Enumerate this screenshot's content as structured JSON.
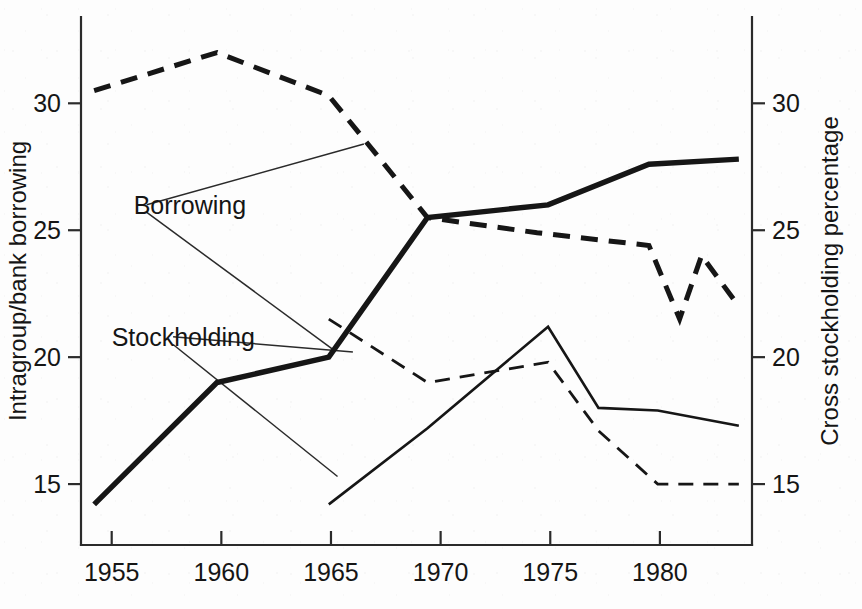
{
  "chart_data": {
    "type": "line",
    "title": "",
    "xlabel": "",
    "ylabel": "Intragroup/bank borrowing",
    "y2label": "Cross stockholding percentage",
    "xlim": [
      1953.6,
      1984.2
    ],
    "ylim": [
      12.6,
      33.4
    ],
    "y2lim": [
      12.6,
      33.4
    ],
    "grid": false,
    "legend_position": "inline-annotations",
    "xticks": [
      1955,
      1960,
      1965,
      1970,
      1975,
      1980
    ],
    "xtick_labels": [
      "1955",
      "1960",
      "1965",
      "1970",
      "1975",
      "1980"
    ],
    "yticks": [
      15,
      20,
      25,
      30
    ],
    "ytick_labels": [
      "15",
      "20",
      "25",
      "30"
    ],
    "y2ticks": [
      15,
      20,
      25,
      30
    ],
    "y2tick_labels": [
      "15",
      "20",
      "25",
      "30"
    ],
    "annotations": [
      {
        "text": "Borrowing",
        "x": 1956.0,
        "y": 26.0
      },
      {
        "text": "Stockholding",
        "x": 1955.0,
        "y": 20.8
      }
    ],
    "series": [
      {
        "name": "Borrowing (intragroup/bank borrowing)",
        "axis": "left",
        "style": "thick-solid",
        "x": [
          1954.2,
          1959.8,
          1964.9,
          1969.4,
          1974.9,
          1979.5,
          1983.6
        ],
        "values": [
          14.2,
          19.0,
          20.0,
          25.5,
          26.0,
          27.6,
          27.8
        ]
      },
      {
        "name": "Borrowing (cross stockholding percentage)",
        "axis": "right",
        "style": "thick-dashed",
        "x": [
          1954.2,
          1959.8,
          1964.9,
          1969.4,
          1974.4,
          1979.5,
          1980.9,
          1981.9,
          1983.6
        ],
        "values": [
          30.5,
          32.0,
          30.3,
          25.5,
          24.9,
          24.4,
          21.5,
          24.0,
          22.0
        ]
      },
      {
        "name": "Stockholding (intragroup/bank borrowing)",
        "axis": "left",
        "style": "thin-solid",
        "x": [
          1964.9,
          1969.4,
          1974.9,
          1977.2,
          1979.9,
          1983.6
        ],
        "values": [
          14.2,
          17.2,
          21.2,
          18.0,
          17.9,
          17.3
        ]
      },
      {
        "name": "Stockholding (cross stockholding percentage)",
        "axis": "right",
        "style": "thin-dashed",
        "x": [
          1964.9,
          1969.4,
          1974.9,
          1977.2,
          1979.9,
          1983.6
        ],
        "values": [
          21.5,
          19.0,
          19.8,
          17.1,
          15.0,
          15.0
        ]
      }
    ],
    "leader_lines": [
      {
        "from": "Borrowing",
        "x1": 1956.6,
        "y1": 26.0,
        "x2": 1966.5,
        "y2": 28.4
      },
      {
        "from": "Borrowing",
        "x1": 1956.6,
        "y1": 25.7,
        "x2": 1965.1,
        "y2": 20.3
      },
      {
        "from": "Stockholding",
        "x1": 1957.8,
        "y1": 20.8,
        "x2": 1966.0,
        "y2": 20.2
      },
      {
        "from": "Stockholding",
        "x1": 1957.8,
        "y1": 20.5,
        "x2": 1965.3,
        "y2": 15.3
      }
    ]
  }
}
